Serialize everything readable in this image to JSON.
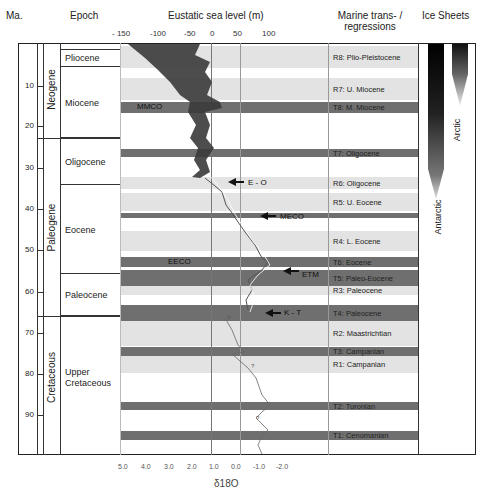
{
  "headers": {
    "ma": "Ma.",
    "epoch": "Epoch",
    "sea_level": "Eustatic sea level (m)",
    "marine_line1": "Marine trans- /",
    "marine_line2": "regressions",
    "ice_sheets": "Ice Sheets"
  },
  "sea_level_ticks": [
    "- 150",
    "-100",
    "-50",
    "0",
    "50",
    "100"
  ],
  "d18o_ticks": [
    "5.0",
    "4.0",
    "3.0",
    "2.0",
    "1.0",
    "0.0",
    "-1.0",
    "-2.0"
  ],
  "d18o_label": "δ18O",
  "ma_ticks": [
    "10",
    "20",
    "30",
    "40",
    "50",
    "60",
    "70",
    "80",
    "90"
  ],
  "periods": [
    "Neogene",
    "Paleogene",
    "Cretaceous"
  ],
  "epochs": [
    "Pliocene",
    "Miocene",
    "Oligocene",
    "Eocene",
    "Paleocene",
    "Upper Cretaceous"
  ],
  "marine_events": [
    {
      "label": "R8: Plio-Pleistocene",
      "type": "regression"
    },
    {
      "label": "R7: U. Miocene",
      "type": "regression"
    },
    {
      "label": "T8: M. Miocene",
      "type": "transgression"
    },
    {
      "label": "T7: Oligocene",
      "type": "transgression"
    },
    {
      "label": "R6: Oligocene",
      "type": "regression"
    },
    {
      "label": "R5: U. Eocene",
      "type": "regression"
    },
    {
      "label": "R4: L. Eocene",
      "type": "regression"
    },
    {
      "label": "T6: Eocene",
      "type": "transgression"
    },
    {
      "label": "T5: Paleo-Eocene",
      "type": "transgression"
    },
    {
      "label": "R3: Paleocene",
      "type": "regression"
    },
    {
      "label": "T4: Paleocene",
      "type": "transgression"
    },
    {
      "label": "R2: Maastrichtian",
      "type": "regression"
    },
    {
      "label": "T3: Campanian",
      "type": "transgression"
    },
    {
      "label": "R1: Campanian",
      "type": "regression"
    },
    {
      "label": "T2: Turonian",
      "type": "transgression"
    },
    {
      "label": "T1: Cenomanian",
      "type": "transgression"
    }
  ],
  "climate_events": [
    "MMCO",
    "E - O",
    "MECO",
    "EECO",
    "ETM",
    "K - T"
  ],
  "ice_sheets": [
    "Antarctic",
    "Arctic"
  ],
  "colors": {
    "transgression": "#6f6f6f",
    "regression": "#e3e3e3",
    "curve": "#3a3a3a"
  }
}
